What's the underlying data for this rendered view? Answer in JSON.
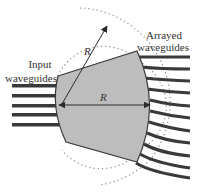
{
  "diagram": {
    "labels": {
      "input_line1": "Input",
      "input_line2": "waveguides",
      "arrayed_line1": "Arrayed",
      "arrayed_line2": "waveguides",
      "radius_diagonal": "R",
      "radius_horizontal": "R"
    },
    "colors": {
      "region_fill": "#bdbdbd",
      "region_stroke": "#3a3a3a",
      "waveguide": "#3a3a3a",
      "arrow": "#2a2a2a",
      "dotted_circle": "#8a8a8a",
      "text": "#333333"
    },
    "input_waveguides_count": 5,
    "arrayed_waveguides_count": 11
  }
}
